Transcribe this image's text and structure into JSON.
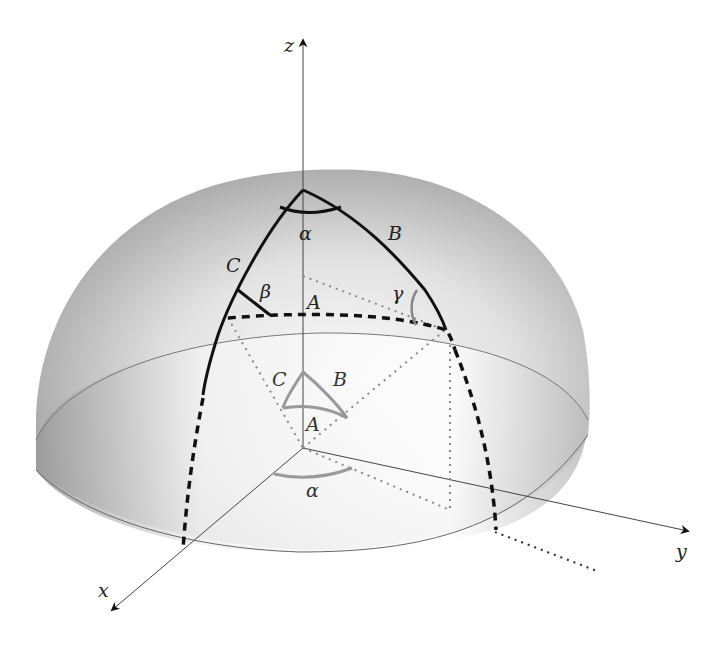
{
  "figure": {
    "axes": {
      "x": "x",
      "y": "y",
      "z": "z"
    },
    "sides": {
      "A": "A",
      "B": "B",
      "C": "C"
    },
    "angles": {
      "alpha": "α",
      "beta": "β",
      "gamma": "γ"
    },
    "inner_triangle": {
      "A": "A",
      "B": "B",
      "C": "C",
      "alpha": "α"
    },
    "colors": {
      "dome_dark": "#8a8a8a",
      "dome_light": "#f4f4f4",
      "lines": "#111111",
      "gray_marks": "#8c8c8c"
    }
  }
}
